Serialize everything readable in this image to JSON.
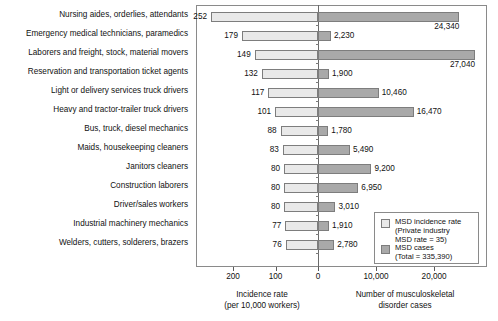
{
  "chart_data": {
    "type": "bar",
    "orientation": "horizontal",
    "layout": "bidirectional-paired",
    "title": "",
    "categories": [
      "Nursing aides, orderlies, attendants",
      "Emergency medical technicians, paramedics",
      "Laborers and freight, stock, material movers",
      "Reservation and transportation ticket agents",
      "Light or delivery services truck drivers",
      "Heavy and tractor-trailer truck drivers",
      "Bus, truck, diesel mechanics",
      "Maids, housekeeping cleaners",
      "Janitors cleaners",
      "Construction laborers",
      "Driver/sales workers",
      "Industrial machinery mechanics",
      "Welders, cutters, solderers, brazers"
    ],
    "series": [
      {
        "name": "MSD incidence rate",
        "axis": "left",
        "values": [
          252,
          179,
          149,
          132,
          117,
          101,
          88,
          83,
          80,
          80,
          80,
          77,
          76
        ],
        "labels": [
          "252",
          "179",
          "149",
          "132",
          "117",
          "101",
          "88",
          "83",
          "80",
          "80",
          "80",
          "77",
          "76"
        ],
        "color": "#e9e9e9"
      },
      {
        "name": "MSD cases",
        "axis": "right",
        "values": [
          24340,
          2230,
          27040,
          1900,
          10460,
          16470,
          1780,
          5490,
          9200,
          6950,
          3010,
          1910,
          2780
        ],
        "labels": [
          "24,340",
          "2,230",
          "27,040",
          "1,900",
          "10,460",
          "16,470",
          "1,780",
          "5,490",
          "9,200",
          "6,950",
          "3,010",
          "1,910",
          "2,780"
        ],
        "color": "#a9a9a9"
      }
    ],
    "left_axis": {
      "label_line1": "Incidence rate",
      "label_line2": "(per 10,000 workers)",
      "ticks": [
        "200",
        "100",
        "0"
      ],
      "range": [
        300,
        0
      ],
      "direction": "reversed"
    },
    "right_axis": {
      "label_line1": "Number of musculoskeletal",
      "label_line2": "disorder cases",
      "ticks": [
        "10,000",
        "20,000"
      ],
      "range": [
        0,
        32000
      ]
    },
    "grid": false,
    "legend_position": "inside-bottom-right"
  },
  "legend": {
    "item1": {
      "swatch": "light",
      "line1": "MSD incidence rate",
      "line2": "(Private industry",
      "line3": "MSD rate = 35)"
    },
    "item2": {
      "swatch": "dark",
      "line1": "MSD cases",
      "line2": "(Total = 335,390)"
    }
  },
  "colors": {
    "bar_light": "#e9e9e9",
    "bar_dark": "#a9a9a9",
    "border": "#7d7d7d",
    "frame": "#8a8a8a",
    "text": "#111111",
    "background": "#ffffff"
  }
}
